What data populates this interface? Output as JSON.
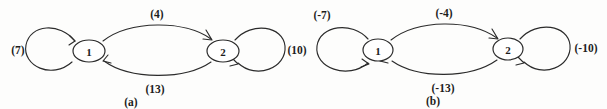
{
  "figure": {
    "background_color": "#fdfdfc",
    "ink_color": "#2b2b2b",
    "panels": [
      {
        "id": "a",
        "caption": "(a)",
        "nodes": [
          {
            "id": "1",
            "label": "1"
          },
          {
            "id": "2",
            "label": "2"
          }
        ],
        "edges": [
          {
            "id": "self-loop-1",
            "from": "1",
            "to": "1",
            "weight_label": "(7)",
            "position": "left"
          },
          {
            "id": "arc-1-to-2",
            "from": "1",
            "to": "2",
            "weight_label": "(4)",
            "position": "top"
          },
          {
            "id": "arc-2-to-1",
            "from": "2",
            "to": "1",
            "weight_label": "(13)",
            "position": "bottom"
          },
          {
            "id": "self-loop-2",
            "from": "2",
            "to": "2",
            "weight_label": "(10)",
            "position": "right"
          }
        ]
      },
      {
        "id": "b",
        "caption": "(b)",
        "nodes": [
          {
            "id": "1",
            "label": "1"
          },
          {
            "id": "2",
            "label": "2"
          }
        ],
        "edges": [
          {
            "id": "self-loop-1",
            "from": "1",
            "to": "1",
            "weight_label": "(-7)",
            "position": "top-left"
          },
          {
            "id": "arc-1-to-2",
            "from": "1",
            "to": "2",
            "weight_label": "(-4)",
            "position": "top"
          },
          {
            "id": "arc-2-to-1",
            "from": "2",
            "to": "1",
            "weight_label": "(-13)",
            "position": "bottom"
          },
          {
            "id": "self-loop-2",
            "from": "2",
            "to": "2",
            "weight_label": "(-10)",
            "position": "right"
          }
        ]
      }
    ]
  }
}
